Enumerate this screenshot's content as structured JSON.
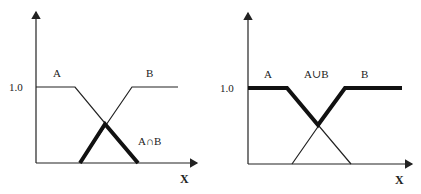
{
  "left_panel": {
    "title": "Intersection",
    "y_tick": "1.0",
    "x_label": "X",
    "set_a_label": "A",
    "set_b_label": "B",
    "result_label": "A∩B"
  },
  "right_panel": {
    "title": "Union",
    "y_tick": "1.0",
    "x_label": "X",
    "set_a_label": "A",
    "set_b_label": "B",
    "result_label": "A∪B"
  },
  "colors": {
    "line": "#222222",
    "background": "#ffffff"
  }
}
